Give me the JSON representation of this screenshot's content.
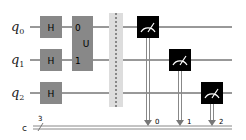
{
  "circuit": {
    "qubits": [
      {
        "name": "q",
        "index": "0"
      },
      {
        "name": "q",
        "index": "1"
      },
      {
        "name": "q",
        "index": "2"
      }
    ],
    "classical_register": {
      "name": "c",
      "size": "3"
    },
    "gates": [
      {
        "type": "H",
        "label": "H",
        "qubit": 0
      },
      {
        "type": "H",
        "label": "H",
        "qubit": 1
      },
      {
        "type": "H",
        "label": "H",
        "qubit": 2
      },
      {
        "type": "U",
        "label": "U",
        "qubits": [
          0,
          1
        ],
        "port_labels": [
          "0",
          "1"
        ]
      },
      {
        "type": "barrier",
        "qubits": [
          0,
          1,
          2
        ]
      },
      {
        "type": "measure",
        "qubit": 0,
        "clbit": "0"
      },
      {
        "type": "measure",
        "qubit": 1,
        "clbit": "1"
      },
      {
        "type": "measure",
        "qubit": 2,
        "clbit": "2"
      }
    ],
    "colors": {
      "gate_fill": "#888888",
      "measure_fill": "#000000",
      "wire": "#333333",
      "classical_wire": "#999999",
      "barrier_fill": "#dddddd"
    }
  }
}
